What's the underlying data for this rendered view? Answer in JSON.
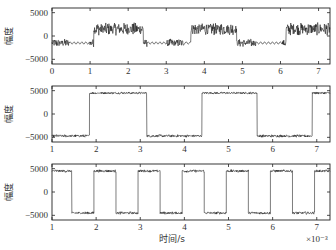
{
  "figure": {
    "xlabel": "时间/s",
    "x_multiplier": "×10⁻³",
    "ylabel": "幅度"
  },
  "chart_data": [
    {
      "type": "line",
      "title": "",
      "xlabel": "",
      "ylabel": "幅度",
      "xlim": [
        0,
        7.3
      ],
      "ylim": [
        -6000,
        6000
      ],
      "xticks": [
        0,
        1,
        2,
        3,
        4,
        5,
        6,
        7
      ],
      "yticks": [
        -5000,
        0,
        5000
      ],
      "yticklabels": [
        "-5000",
        "0",
        "5000"
      ],
      "grid": false,
      "description": "Noisy composite signal switching between ~-1500 and ~+1500 with high-frequency bursts and low-amplitude ripple segments",
      "segments": [
        {
          "x0": 0.0,
          "x1": 0.45,
          "level": -1500,
          "style": "noisy",
          "amp": 900
        },
        {
          "x0": 0.45,
          "x1": 1.0,
          "level": -1500,
          "style": "ripple",
          "amp": 250
        },
        {
          "x0": 1.0,
          "x1": 1.1,
          "level": -1500,
          "style": "noisy",
          "amp": 900
        },
        {
          "x0": 1.1,
          "x1": 2.4,
          "level": 1500,
          "style": "noisy",
          "amp": 1400
        },
        {
          "x0": 2.4,
          "x1": 2.5,
          "level": -1500,
          "style": "noisy",
          "amp": 900
        },
        {
          "x0": 2.5,
          "x1": 3.0,
          "level": -1500,
          "style": "ripple",
          "amp": 250
        },
        {
          "x0": 3.0,
          "x1": 3.5,
          "level": -1500,
          "style": "noisy",
          "amp": 900
        },
        {
          "x0": 3.5,
          "x1": 3.65,
          "level": -1500,
          "style": "ripple",
          "amp": 250
        },
        {
          "x0": 3.65,
          "x1": 4.85,
          "level": 1500,
          "style": "noisy",
          "amp": 1400
        },
        {
          "x0": 4.85,
          "x1": 5.35,
          "level": -1500,
          "style": "noisy",
          "amp": 900
        },
        {
          "x0": 5.35,
          "x1": 6.05,
          "level": -1500,
          "style": "ripple",
          "amp": 250
        },
        {
          "x0": 6.05,
          "x1": 6.15,
          "level": -1500,
          "style": "noisy",
          "amp": 900
        },
        {
          "x0": 6.15,
          "x1": 7.3,
          "level": 1500,
          "style": "noisy",
          "amp": 1400
        }
      ]
    },
    {
      "type": "line",
      "title": "",
      "xlabel": "",
      "ylabel": "幅度",
      "xlim": [
        1,
        7.3
      ],
      "ylim": [
        -6000,
        6000
      ],
      "xticks": [
        1,
        2,
        3,
        4,
        5,
        6,
        7
      ],
      "yticks": [
        -5000,
        0,
        5000
      ],
      "yticklabels": [
        "-5000",
        "0",
        "5000"
      ],
      "grid": false,
      "description": "Square wave ±4500 with small noise, period ~2.5 ms",
      "segments": [
        {
          "x0": 1.0,
          "x1": 1.85,
          "level": -4700,
          "style": "noisy",
          "amp": 300
        },
        {
          "x0": 1.85,
          "x1": 3.15,
          "level": 4500,
          "style": "noisy",
          "amp": 250
        },
        {
          "x0": 3.15,
          "x1": 4.4,
          "level": -4700,
          "style": "noisy",
          "amp": 300
        },
        {
          "x0": 4.4,
          "x1": 5.65,
          "level": 4500,
          "style": "noisy",
          "amp": 250
        },
        {
          "x0": 5.65,
          "x1": 6.9,
          "level": -4700,
          "style": "noisy",
          "amp": 300
        },
        {
          "x0": 6.9,
          "x1": 7.3,
          "level": 4500,
          "style": "noisy",
          "amp": 250
        }
      ]
    },
    {
      "type": "line",
      "title": "",
      "xlabel": "时间/s",
      "ylabel": "幅度",
      "x_multiplier": "×10⁻³",
      "xlim": [
        1,
        7.3
      ],
      "ylim": [
        -6000,
        6000
      ],
      "xticks": [
        1,
        2,
        3,
        4,
        5,
        6,
        7
      ],
      "yticks": [
        -5000,
        0,
        5000
      ],
      "yticklabels": [
        "-5000",
        "0",
        "5000"
      ],
      "grid": false,
      "description": "Square wave ±4500 with small noise, period ~1 ms",
      "segments": [
        {
          "x0": 1.0,
          "x1": 1.45,
          "level": 4500,
          "style": "noisy",
          "amp": 300
        },
        {
          "x0": 1.45,
          "x1": 1.95,
          "level": -4500,
          "style": "noisy",
          "amp": 300
        },
        {
          "x0": 1.95,
          "x1": 2.45,
          "level": 4500,
          "style": "noisy",
          "amp": 300
        },
        {
          "x0": 2.45,
          "x1": 2.95,
          "level": -4500,
          "style": "noisy",
          "amp": 300
        },
        {
          "x0": 2.95,
          "x1": 3.45,
          "level": 4500,
          "style": "noisy",
          "amp": 300
        },
        {
          "x0": 3.45,
          "x1": 3.95,
          "level": -4500,
          "style": "noisy",
          "amp": 300
        },
        {
          "x0": 3.95,
          "x1": 4.45,
          "level": 4500,
          "style": "noisy",
          "amp": 300
        },
        {
          "x0": 4.45,
          "x1": 4.95,
          "level": -4500,
          "style": "noisy",
          "amp": 300
        },
        {
          "x0": 4.95,
          "x1": 5.45,
          "level": 4500,
          "style": "noisy",
          "amp": 300
        },
        {
          "x0": 5.45,
          "x1": 5.95,
          "level": -4500,
          "style": "noisy",
          "amp": 300
        },
        {
          "x0": 5.95,
          "x1": 6.45,
          "level": 4500,
          "style": "noisy",
          "amp": 300
        },
        {
          "x0": 6.45,
          "x1": 6.95,
          "level": -4500,
          "style": "noisy",
          "amp": 300
        },
        {
          "x0": 6.95,
          "x1": 7.3,
          "level": 4500,
          "style": "noisy",
          "amp": 300
        }
      ]
    }
  ]
}
